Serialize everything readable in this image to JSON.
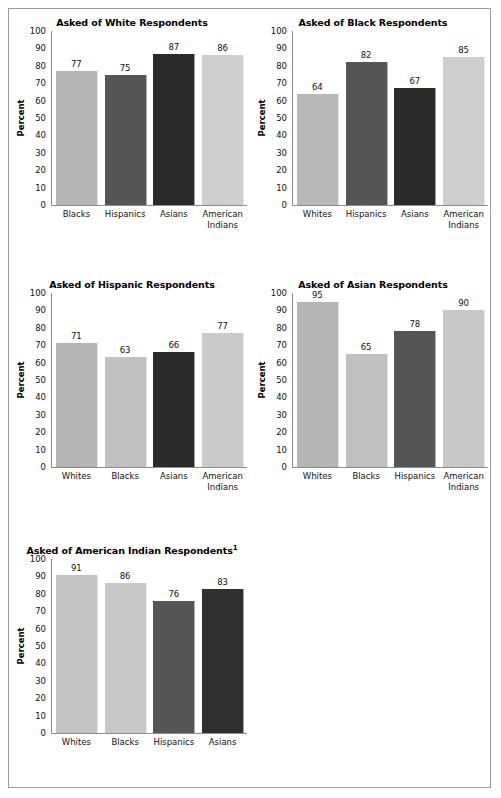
{
  "page": {
    "background": "#ffffff",
    "border_color": "#9a9a9a"
  },
  "palette": {
    "whites": "#b8b8b8",
    "blacks": "#c4c4c4",
    "hispanics": "#555555",
    "asians": "#2b2b2b",
    "american_indians": "#cecece",
    "axis": "#8c8c8c",
    "text": "#111111"
  },
  "axis": {
    "ylabel": "Percent",
    "yticks": [
      "100",
      "90",
      "80",
      "70",
      "60",
      "50",
      "40",
      "30",
      "20",
      "10",
      "0"
    ],
    "ymin": 0,
    "ymax": 100
  },
  "chart_data": [
    {
      "type": "bar",
      "title": "Asked of White Respondents",
      "title_superscript": "",
      "ylabel": "Percent",
      "xlabel": "",
      "ylim": [
        0,
        100
      ],
      "grid": false,
      "legend": "none",
      "categories": [
        "Blacks",
        "Hispanics",
        "Asians",
        "American Indians"
      ],
      "category_lines": [
        [
          "Blacks"
        ],
        [
          "Hispanics"
        ],
        [
          "Asians"
        ],
        [
          "American",
          "Indians"
        ]
      ],
      "values": [
        77,
        75,
        87,
        86
      ],
      "colors": [
        "#b5b5b5",
        "#555555",
        "#2a2a2a",
        "#cecece"
      ]
    },
    {
      "type": "bar",
      "title": "Asked of Black Respondents",
      "title_superscript": "",
      "ylabel": "Percent",
      "xlabel": "",
      "ylim": [
        0,
        100
      ],
      "grid": false,
      "legend": "none",
      "categories": [
        "Whites",
        "Hispanics",
        "Asians",
        "American Indians"
      ],
      "category_lines": [
        [
          "Whites"
        ],
        [
          "Hispanics"
        ],
        [
          "Asians"
        ],
        [
          "American",
          "Indians"
        ]
      ],
      "values": [
        64,
        82,
        67,
        85
      ],
      "colors": [
        "#b8b8b8",
        "#555555",
        "#2a2a2a",
        "#cecece"
      ]
    },
    {
      "type": "bar",
      "title": "Asked of Hispanic Respondents",
      "title_superscript": "",
      "ylabel": "Percent",
      "xlabel": "",
      "ylim": [
        0,
        100
      ],
      "grid": false,
      "legend": "none",
      "categories": [
        "Whites",
        "Blacks",
        "Asians",
        "American Indians"
      ],
      "category_lines": [
        [
          "Whites"
        ],
        [
          "Blacks"
        ],
        [
          "Asians"
        ],
        [
          "American",
          "Indians"
        ]
      ],
      "values": [
        71,
        63,
        66,
        77
      ],
      "colors": [
        "#b5b5b5",
        "#c0c0c0",
        "#2a2a2a",
        "#cacaca"
      ]
    },
    {
      "type": "bar",
      "title": "Asked of Asian Respondents",
      "title_superscript": "",
      "ylabel": "Percent",
      "xlabel": "",
      "ylim": [
        0,
        100
      ],
      "grid": false,
      "legend": "none",
      "categories": [
        "Whites",
        "Blacks",
        "Hispanics",
        "American Indians"
      ],
      "category_lines": [
        [
          "Whites"
        ],
        [
          "Blacks"
        ],
        [
          "Hispanics"
        ],
        [
          "American",
          "Indians"
        ]
      ],
      "values": [
        95,
        65,
        78,
        90
      ],
      "colors": [
        "#b5b5b5",
        "#c0c0c0",
        "#555555",
        "#c8c8c8"
      ]
    },
    {
      "type": "bar",
      "title": "Asked of American Indian Respondents",
      "title_superscript": "1",
      "ylabel": "Percent",
      "xlabel": "",
      "ylim": [
        0,
        100
      ],
      "grid": false,
      "legend": "none",
      "categories": [
        "Whites",
        "Blacks",
        "Hispanics",
        "Asians"
      ],
      "category_lines": [
        [
          "Whites"
        ],
        [
          "Blacks"
        ],
        [
          "Hispanics"
        ],
        [
          "Asians"
        ]
      ],
      "values": [
        91,
        86,
        76,
        83
      ],
      "colors": [
        "#c3c3c3",
        "#c8c8c8",
        "#555555",
        "#2f2f2f"
      ]
    }
  ]
}
